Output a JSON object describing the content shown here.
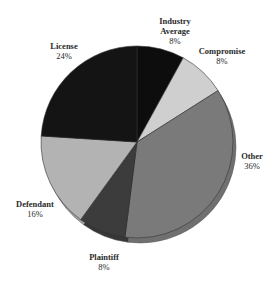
{
  "chart_data": {
    "type": "pie",
    "title": "",
    "style": "3d-rim",
    "start_angle_deg": 0,
    "direction": "clockwise",
    "categories": [
      "Industry Average",
      "Compromise",
      "Other",
      "Plaintiff",
      "Defendant",
      "License"
    ],
    "values": [
      8,
      8,
      36,
      8,
      16,
      24
    ],
    "unit": "%",
    "colors": [
      "#0d0d0d",
      "#cfcfcf",
      "#7a7a7a",
      "#3c3c3c",
      "#b3b3b3",
      "#141414"
    ],
    "labels": [
      {
        "name": "Industry Average",
        "line1": "Industry",
        "line2": "Average",
        "pct": "8%"
      },
      {
        "name": "Compromise",
        "line1": "Compromise",
        "pct": "8%"
      },
      {
        "name": "Other",
        "line1": "Other",
        "pct": "36%"
      },
      {
        "name": "Plaintiff",
        "line1": "Plaintiff",
        "pct": "8%"
      },
      {
        "name": "Defendant",
        "line1": "Defendant",
        "pct": "16%"
      },
      {
        "name": "License",
        "line1": "License",
        "pct": "24%"
      }
    ],
    "legend": "none (direct labels)"
  }
}
